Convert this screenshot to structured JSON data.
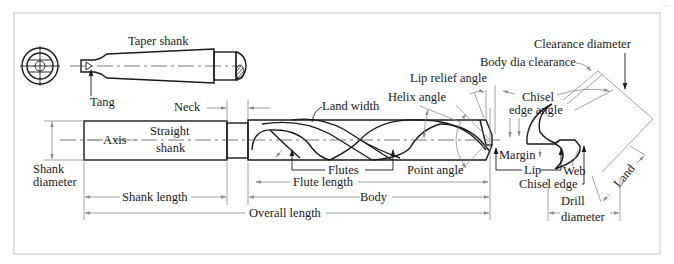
{
  "figure": {
    "colors": {
      "line": "#1a1a1a",
      "dimension": "#8c8c8c",
      "frame": "#cfcfcf",
      "background": "#ffffff"
    }
  },
  "labels": {
    "taper_shank": "Taper shank",
    "tang": "Tang",
    "neck": "Neck",
    "axis": "Axis",
    "straight": "Straight",
    "shank": "shank",
    "shank_diameter_1": "Shank",
    "shank_diameter_2": "diameter",
    "shank_length": "Shank length",
    "overall_length": "Overall length",
    "land_width": "Land width",
    "helix_angle": "Helix angle",
    "lip_relief_angle": "Lip relief angle",
    "flutes": "Flutes",
    "flute_length": "Flute length",
    "body": "Body",
    "point_angle": "Point angle",
    "margin": "Margin",
    "lip": "Lip",
    "body_dia_clearance": "Body dia clearance",
    "clearance_diameter": "Clearance diameter",
    "chisel_edge_angle_1": "Chisel",
    "chisel_edge_angle_2": "edge angle",
    "web": "Web",
    "chisel_edge": "Chisel edge",
    "land": "Land",
    "drill_diameter_1": "Drill",
    "drill_diameter_2": "diameter"
  }
}
